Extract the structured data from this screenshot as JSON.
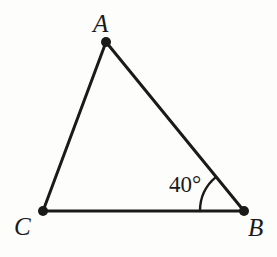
{
  "figure": {
    "kind": "geometry-diagram",
    "shape": "triangle",
    "name": "Triangle ABC",
    "background_color": "#fdfdfb",
    "stroke_color": "#1a1a1a",
    "stroke_width": 3,
    "vertex_dot_radius": 5
  },
  "vertices": [
    {
      "id": "A",
      "label": "A",
      "x": 106,
      "y": 42,
      "label_x": 93,
      "label_y": 11
    },
    {
      "id": "B",
      "label": "B",
      "x": 244,
      "y": 211,
      "label_x": 248,
      "label_y": 215
    },
    {
      "id": "C",
      "label": "C",
      "x": 43,
      "y": 211,
      "label_x": 14,
      "label_y": 214
    }
  ],
  "edges": [
    {
      "id": "CA",
      "from": "C",
      "to": "A"
    },
    {
      "id": "AB",
      "from": "A",
      "to": "B"
    },
    {
      "id": "CB",
      "from": "C",
      "to": "B"
    }
  ],
  "angles": [
    {
      "id": "angle-B",
      "at_vertex": "B",
      "label": "40°",
      "value": 40,
      "unit": "degrees",
      "arc_radius": 44,
      "label_x": 169,
      "label_y": 173
    }
  ],
  "chart_data": {
    "type": "diagram",
    "points": {
      "A": [
        106,
        42
      ],
      "B": [
        244,
        211
      ],
      "C": [
        43,
        211
      ]
    },
    "segments": [
      [
        "C",
        "A"
      ],
      [
        "A",
        "B"
      ],
      [
        "C",
        "B"
      ]
    ],
    "annotations": [
      {
        "text": "A",
        "at": [
          106,
          42
        ],
        "kind": "vertex-label"
      },
      {
        "text": "B",
        "at": [
          244,
          211
        ],
        "kind": "vertex-label"
      },
      {
        "text": "C",
        "at": [
          43,
          211
        ],
        "kind": "vertex-label"
      },
      {
        "text": "40°",
        "at": [
          244,
          211
        ],
        "kind": "angle-measure",
        "measured_angle": "ABC"
      }
    ]
  }
}
